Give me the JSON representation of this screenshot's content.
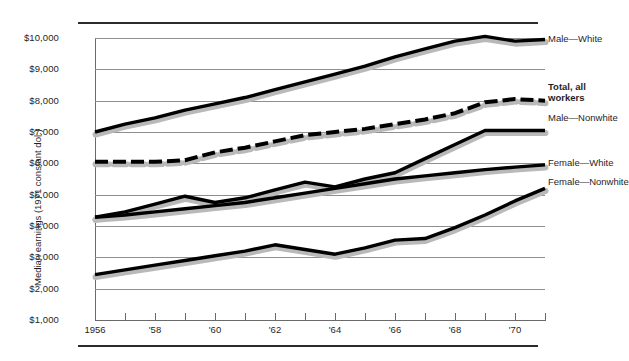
{
  "chart_data": {
    "type": "line",
    "title": "",
    "xlabel": "",
    "ylabel": "Median earnings (1971 constant dol.)",
    "xlim": [
      1956,
      1971
    ],
    "ylim": [
      1000,
      10000
    ],
    "grid": true,
    "legend_position": "right-inline-labels",
    "x": [
      1956,
      1957,
      1958,
      1959,
      1960,
      1961,
      1962,
      1963,
      1964,
      1965,
      1966,
      1967,
      1968,
      1969,
      1970,
      1971
    ],
    "ytick_labels": [
      "$10,000",
      "$9,000",
      "$8,000",
      "$7,000",
      "$6,000",
      "$5,000",
      "$4,000",
      "$3,000",
      "$2,000",
      "$1,000"
    ],
    "ytick_values": [
      10000,
      9000,
      8000,
      7000,
      6000,
      5000,
      4000,
      3000,
      2000,
      1000
    ],
    "xtick_values": [
      1956,
      1957,
      1958,
      1959,
      1960,
      1961,
      1962,
      1963,
      1964,
      1965,
      1966,
      1967,
      1968,
      1969,
      1970,
      1971
    ],
    "xtick_labels": [
      "1956",
      "",
      "'58",
      "",
      "'60",
      "",
      "'62",
      "",
      "'64",
      "",
      "'66",
      "",
      "'68",
      "",
      "'70",
      ""
    ],
    "series": [
      {
        "name": "Male—White",
        "style": "solid",
        "label_lines": [
          "Male—White"
        ],
        "values": [
          7000,
          7250,
          7450,
          7700,
          7900,
          8100,
          8350,
          8600,
          8850,
          9100,
          9400,
          9650,
          9900,
          10050,
          9900,
          9950
        ]
      },
      {
        "name": "Total, all workers",
        "style": "dashed",
        "label_lines": [
          "Total, all",
          "workers"
        ],
        "values": [
          6050,
          6050,
          6050,
          6100,
          6350,
          6500,
          6700,
          6900,
          7000,
          7100,
          7250,
          7400,
          7600,
          7950,
          8050,
          8000
        ]
      },
      {
        "name": "Male—Nonwhite",
        "style": "solid",
        "label_lines": [
          "Male—Nonwhite"
        ],
        "values": [
          4280,
          4450,
          4700,
          4950,
          4750,
          4900,
          5150,
          5400,
          5250,
          5500,
          5700,
          6150,
          6600,
          7050,
          7050,
          7050
        ]
      },
      {
        "name": "Female—White",
        "style": "solid",
        "label_lines": [
          "Female—White"
        ],
        "values": [
          4280,
          4350,
          4450,
          4550,
          4650,
          4750,
          4900,
          5050,
          5200,
          5350,
          5500,
          5600,
          5700,
          5800,
          5880,
          5950
        ]
      },
      {
        "name": "Female—Nonwhite",
        "style": "solid",
        "label_lines": [
          "Female—Nonwhite"
        ],
        "values": [
          2450,
          2600,
          2750,
          2900,
          3050,
          3200,
          3400,
          3250,
          3100,
          3300,
          3550,
          3600,
          3950,
          4350,
          4800,
          5200
        ]
      }
    ]
  },
  "labels": {
    "male_white": "Male—White",
    "total_line1": "Total, all",
    "total_line2": "workers",
    "male_nonwhite": "Male—Nonwhite",
    "female_white": "Female—White",
    "female_nonwhite": "Female—Nonwhite"
  },
  "colors": {
    "line": "#000000",
    "shadow": "#b9b9b9",
    "grid": "#8e8e8e",
    "rule": "#2b2b2b",
    "text": "#1f1f1f"
  }
}
